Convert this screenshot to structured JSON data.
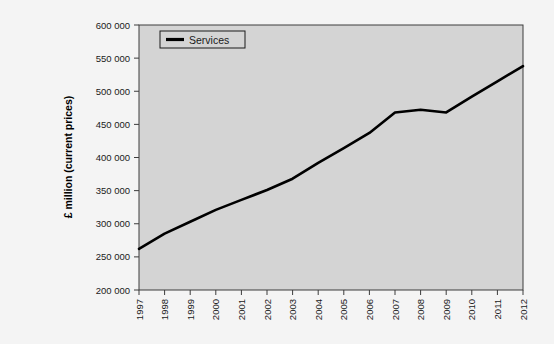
{
  "chart_data": {
    "type": "line",
    "title": "",
    "xlabel": "",
    "ylabel": "£ million (current prices)",
    "categories": [
      "1997",
      "1998",
      "1999",
      "2000",
      "2001",
      "2002",
      "2003",
      "2004",
      "2005",
      "2006",
      "2007",
      "2008",
      "2009",
      "2010",
      "2011",
      "2012"
    ],
    "series": [
      {
        "name": "Services",
        "color": "#000000",
        "values": [
          262000,
          285000,
          303000,
          321000,
          336000,
          351000,
          368000,
          392000,
          414000,
          437000,
          468000,
          472000,
          468000,
          492000,
          515000,
          538000
        ]
      }
    ],
    "ylim": [
      200000,
      600000
    ],
    "ytick_step": 50000,
    "ytick_labels": [
      "200 000",
      "250 000",
      "300 000",
      "350 000",
      "400 000",
      "450 000",
      "500 000",
      "550 000",
      "600 000"
    ],
    "ytick_values": [
      200000,
      250000,
      300000,
      350000,
      400000,
      450000,
      500000,
      550000,
      600000
    ],
    "grid": false,
    "legend_position": "top-left",
    "legend_entries": [
      "Services"
    ],
    "plot_background": "#d4d4d4",
    "page_background": "#f4f4f4",
    "axis_color": "#3c3c3c"
  },
  "legend": {
    "services_label": "Services"
  },
  "axes": {
    "y_title": "£ million (current prices)"
  },
  "caption": {
    "text": ""
  }
}
